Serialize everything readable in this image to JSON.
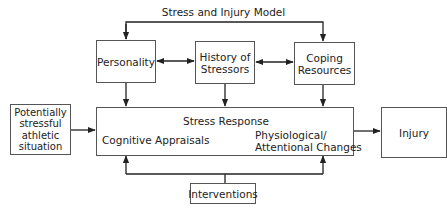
{
  "title": "Stress and Injury Model",
  "nodes": {
    "personality": "Personality",
    "history_line1": "History of",
    "history_line2": "Stressors",
    "coping_line1": "Coping",
    "coping_line2": "Resources",
    "situation_line1": "Potentially",
    "situation_line2": "stressful",
    "situation_line3": "athletic",
    "situation_line4": "situation",
    "stress_response_title": "Stress Response",
    "cognitive": "Cognitive Appraisals",
    "physio_line1": "Physiological/",
    "physio_line2": "Attentional Changes",
    "injury": "Injury",
    "interventions": "Interventions"
  },
  "edges": [
    {
      "from": "top-bracket",
      "to": "personality"
    },
    {
      "from": "top-bracket",
      "to": "coping-resources"
    },
    {
      "from": "personality",
      "to": "history-of-stressors",
      "bidirectional": true
    },
    {
      "from": "history-of-stressors",
      "to": "coping-resources",
      "bidirectional": true
    },
    {
      "from": "personality",
      "to": "stress-response"
    },
    {
      "from": "history-of-stressors",
      "to": "stress-response"
    },
    {
      "from": "coping-resources",
      "to": "stress-response"
    },
    {
      "from": "potentially-stressful-athletic-situation",
      "to": "stress-response"
    },
    {
      "from": "cognitive-appraisals",
      "to": "physiological-attentional-changes",
      "bidirectional": true
    },
    {
      "from": "stress-response",
      "to": "injury"
    },
    {
      "from": "interventions",
      "to": "stress-response"
    }
  ]
}
